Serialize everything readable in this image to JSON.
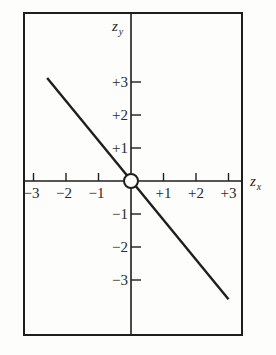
{
  "chart_data": {
    "type": "line",
    "title": "",
    "xlabel": "z_x",
    "ylabel": "z_y",
    "xlabel_parts": {
      "base": "z",
      "sub": "x"
    },
    "ylabel_parts": {
      "base": "z",
      "sub": "y"
    },
    "xlim": [
      -3.3,
      3.4
    ],
    "ylim": [
      -4.6,
      5.1
    ],
    "x_ticks": [
      -3,
      -2,
      -1,
      1,
      2,
      3
    ],
    "x_tick_labels": [
      "−3",
      "−2",
      "−1",
      "+1",
      "+2",
      "+3"
    ],
    "y_ticks": [
      3,
      2,
      1,
      -1,
      -2,
      -3
    ],
    "y_tick_labels": [
      "+3",
      "+2",
      "+1",
      "−1",
      "−2",
      "−3"
    ],
    "grid": false,
    "legend": null,
    "series": [
      {
        "name": "regression line",
        "x": [
          -2.58,
          3.0
        ],
        "y": [
          3.12,
          -3.58
        ],
        "color": "#1e1e1e"
      }
    ],
    "annotations": [
      {
        "type": "open-circle",
        "x": 0,
        "y": 0,
        "label": "origin"
      }
    ]
  },
  "style": {
    "ink": "#1e1e1e",
    "paper": "#fdfdfb"
  }
}
